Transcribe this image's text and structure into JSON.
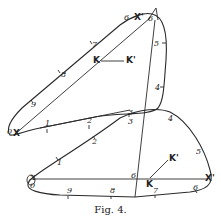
{
  "figure": {
    "caption": "Fig. 4.",
    "upper_loop": {
      "outer_points": [
        "0",
        "9",
        "8",
        "7",
        "6"
      ],
      "right_points": [
        "5",
        "4"
      ],
      "lower_points": [
        "1",
        "2",
        "3"
      ],
      "x_label": "X",
      "x_prime_label": "X'",
      "k_label": "K",
      "k_prime_label": "K'",
      "apex_label": "6"
    },
    "lower_loop": {
      "upper_points": [
        "1",
        "2",
        "3",
        "4",
        "5"
      ],
      "lower_points": [
        "9",
        "8",
        "7",
        "6"
      ],
      "origin_label": "0",
      "x_label": "X",
      "x_prime_label": "X'",
      "k_label": "K",
      "k_prime_label": "K'",
      "mid_label": "6"
    },
    "stroke_color": "#2a2a2a"
  }
}
